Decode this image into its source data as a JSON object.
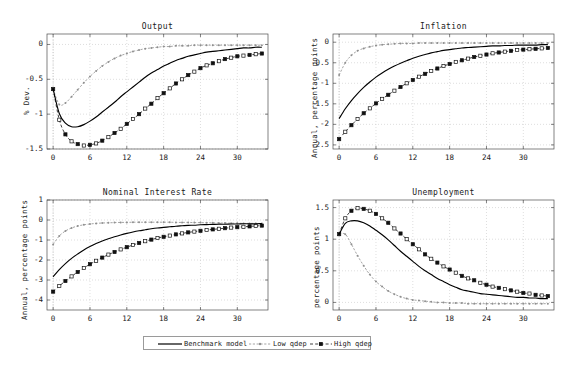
{
  "figure": {
    "width": 570,
    "height": 368,
    "background": "#ffffff",
    "foreground": "#1a1a1a"
  },
  "legend": {
    "entries": [
      {
        "label": "Benchmark model",
        "style": "solid-line",
        "color": "#000000"
      },
      {
        "label": "Low qdep",
        "style": "dotted-line-dot-marker",
        "color": "#8c8c8c"
      },
      {
        "label": "High qdep",
        "style": "dashed-line-square-marker",
        "color": "#000000"
      }
    ]
  },
  "chart_data": [
    {
      "type": "line",
      "title": "Output",
      "xlabel": "",
      "ylabel": "% Dev.",
      "xlim": [
        -1,
        35
      ],
      "ylim": [
        -1.5,
        0.15
      ],
      "xticks": [
        0,
        6,
        12,
        18,
        24,
        30
      ],
      "yticks": [
        0,
        -0.5,
        -1,
        -1.5
      ],
      "ytick_labels": [
        "0",
        "-0.5",
        "-1",
        "-1.5"
      ],
      "grid": true,
      "legend_position": "below-figure",
      "x": [
        0,
        1,
        2,
        3,
        4,
        5,
        6,
        7,
        8,
        9,
        10,
        11,
        12,
        13,
        14,
        15,
        16,
        17,
        18,
        19,
        20,
        21,
        22,
        23,
        24,
        25,
        26,
        27,
        28,
        29,
        30,
        31,
        32,
        33,
        34
      ],
      "series": [
        {
          "name": "Benchmark model",
          "values": [
            -0.64,
            -0.99,
            -1.13,
            -1.18,
            -1.18,
            -1.15,
            -1.1,
            -1.04,
            -0.97,
            -0.9,
            -0.83,
            -0.75,
            -0.68,
            -0.61,
            -0.54,
            -0.47,
            -0.41,
            -0.36,
            -0.31,
            -0.27,
            -0.23,
            -0.2,
            -0.17,
            -0.15,
            -0.13,
            -0.11,
            -0.1,
            -0.09,
            -0.08,
            -0.07,
            -0.06,
            -0.05,
            -0.05,
            -0.04,
            -0.04
          ]
        },
        {
          "name": "Low qdep",
          "values": [
            -0.64,
            -0.86,
            -0.84,
            -0.75,
            -0.65,
            -0.55,
            -0.46,
            -0.38,
            -0.31,
            -0.25,
            -0.2,
            -0.16,
            -0.13,
            -0.1,
            -0.08,
            -0.06,
            -0.05,
            -0.04,
            -0.03,
            -0.03,
            -0.02,
            -0.02,
            -0.02,
            -0.01,
            -0.01,
            -0.01,
            -0.01,
            -0.01,
            -0.01,
            -0.01,
            -0.01,
            -0.01,
            -0.01,
            -0.01,
            -0.01
          ]
        },
        {
          "name": "High qdep",
          "values": [
            -0.64,
            -1.08,
            -1.29,
            -1.39,
            -1.43,
            -1.45,
            -1.44,
            -1.42,
            -1.38,
            -1.33,
            -1.27,
            -1.21,
            -1.14,
            -1.07,
            -1.0,
            -0.92,
            -0.85,
            -0.77,
            -0.7,
            -0.63,
            -0.56,
            -0.5,
            -0.44,
            -0.39,
            -0.34,
            -0.3,
            -0.27,
            -0.24,
            -0.21,
            -0.19,
            -0.17,
            -0.16,
            -0.15,
            -0.14,
            -0.13
          ]
        }
      ]
    },
    {
      "type": "line",
      "title": "Inflation",
      "xlabel": "",
      "ylabel": "Annual, percentage points",
      "xlim": [
        -1,
        35
      ],
      "ylim": [
        -2.6,
        0.2
      ],
      "xticks": [
        0,
        6,
        12,
        18,
        24,
        30
      ],
      "yticks": [
        0,
        -0.5,
        -1,
        -1.5,
        -2,
        -2.5
      ],
      "ytick_labels": [
        "0",
        "-0.5",
        "-1",
        "-1.5",
        "-2",
        "-2.5"
      ],
      "grid": true,
      "legend_position": "below-figure",
      "x": [
        0,
        1,
        2,
        3,
        4,
        5,
        6,
        7,
        8,
        9,
        10,
        11,
        12,
        13,
        14,
        15,
        16,
        17,
        18,
        19,
        20,
        21,
        22,
        23,
        24,
        25,
        26,
        27,
        28,
        29,
        30,
        31,
        32,
        33,
        34
      ],
      "series": [
        {
          "name": "Benchmark model",
          "values": [
            -1.86,
            -1.62,
            -1.42,
            -1.25,
            -1.1,
            -0.97,
            -0.85,
            -0.75,
            -0.66,
            -0.58,
            -0.51,
            -0.45,
            -0.39,
            -0.34,
            -0.3,
            -0.26,
            -0.23,
            -0.2,
            -0.18,
            -0.16,
            -0.14,
            -0.13,
            -0.12,
            -0.11,
            -0.1,
            -0.09,
            -0.09,
            -0.08,
            -0.08,
            -0.07,
            -0.07,
            -0.07,
            -0.07,
            -0.06,
            -0.06
          ]
        },
        {
          "name": "Low qdep",
          "values": [
            -0.8,
            -0.5,
            -0.32,
            -0.21,
            -0.15,
            -0.11,
            -0.08,
            -0.06,
            -0.05,
            -0.04,
            -0.03,
            -0.03,
            -0.03,
            -0.02,
            -0.02,
            -0.02,
            -0.02,
            -0.02,
            -0.02,
            -0.02,
            -0.02,
            -0.02,
            -0.02,
            -0.02,
            -0.02,
            -0.02,
            -0.02,
            -0.02,
            -0.02,
            -0.02,
            -0.02,
            -0.02,
            -0.02,
            -0.02,
            -0.02
          ]
        },
        {
          "name": "High qdep",
          "values": [
            -2.36,
            -2.18,
            -2.02,
            -1.87,
            -1.73,
            -1.61,
            -1.49,
            -1.38,
            -1.28,
            -1.18,
            -1.09,
            -1.0,
            -0.92,
            -0.84,
            -0.77,
            -0.7,
            -0.64,
            -0.58,
            -0.53,
            -0.48,
            -0.44,
            -0.4,
            -0.36,
            -0.33,
            -0.3,
            -0.27,
            -0.25,
            -0.23,
            -0.21,
            -0.19,
            -0.18,
            -0.17,
            -0.16,
            -0.15,
            -0.14
          ]
        }
      ]
    },
    {
      "type": "line",
      "title": "Nominal Interest Rate",
      "xlabel": "",
      "ylabel": "Annual, percentage points",
      "xlim": [
        -1,
        35
      ],
      "ylim": [
        -4.5,
        1.0
      ],
      "xticks": [
        0,
        6,
        12,
        18,
        24,
        30
      ],
      "yticks": [
        1,
        0,
        -1,
        -2,
        -3,
        -4
      ],
      "ytick_labels": [
        "1",
        "0",
        "-1",
        "-2",
        "-3",
        "-4"
      ],
      "grid": true,
      "legend_position": "below-figure",
      "x": [
        0,
        1,
        2,
        3,
        4,
        5,
        6,
        7,
        8,
        9,
        10,
        11,
        12,
        13,
        14,
        15,
        16,
        17,
        18,
        19,
        20,
        21,
        22,
        23,
        24,
        25,
        26,
        27,
        28,
        29,
        30,
        31,
        32,
        33,
        34
      ],
      "series": [
        {
          "name": "Benchmark model",
          "values": [
            -2.84,
            -2.48,
            -2.18,
            -1.92,
            -1.7,
            -1.5,
            -1.33,
            -1.18,
            -1.05,
            -0.94,
            -0.84,
            -0.75,
            -0.67,
            -0.6,
            -0.54,
            -0.49,
            -0.44,
            -0.4,
            -0.37,
            -0.34,
            -0.31,
            -0.29,
            -0.27,
            -0.26,
            -0.24,
            -0.23,
            -0.22,
            -0.21,
            -0.21,
            -0.2,
            -0.2,
            -0.19,
            -0.19,
            -0.19,
            -0.18
          ]
        },
        {
          "name": "Low qdep",
          "values": [
            -1.22,
            -0.8,
            -0.55,
            -0.4,
            -0.3,
            -0.24,
            -0.2,
            -0.17,
            -0.15,
            -0.14,
            -0.13,
            -0.12,
            -0.12,
            -0.11,
            -0.11,
            -0.11,
            -0.11,
            -0.11,
            -0.11,
            -0.11,
            -0.12,
            -0.12,
            -0.12,
            -0.13,
            -0.13,
            -0.14,
            -0.14,
            -0.15,
            -0.15,
            -0.16,
            -0.16,
            -0.17,
            -0.17,
            -0.17,
            -0.18
          ]
        },
        {
          "name": "High qdep",
          "values": [
            -3.58,
            -3.3,
            -3.05,
            -2.82,
            -2.6,
            -2.4,
            -2.21,
            -2.04,
            -1.88,
            -1.73,
            -1.6,
            -1.47,
            -1.36,
            -1.25,
            -1.15,
            -1.06,
            -0.98,
            -0.9,
            -0.84,
            -0.78,
            -0.72,
            -0.67,
            -0.62,
            -0.58,
            -0.54,
            -0.5,
            -0.47,
            -0.44,
            -0.41,
            -0.38,
            -0.36,
            -0.34,
            -0.32,
            -0.3,
            -0.28
          ]
        }
      ]
    },
    {
      "type": "line",
      "title": "Unemployment",
      "xlabel": "",
      "ylabel": "percentage points",
      "xlim": [
        -1,
        35
      ],
      "ylim": [
        -0.12,
        1.62
      ],
      "xticks": [
        0,
        6,
        12,
        18,
        24,
        30
      ],
      "yticks": [
        1.5,
        1,
        0.5,
        0
      ],
      "ytick_labels": [
        "1.5",
        "1",
        "0.5",
        "0"
      ],
      "grid": true,
      "legend_position": "below-figure",
      "x": [
        0,
        1,
        2,
        3,
        4,
        5,
        6,
        7,
        8,
        9,
        10,
        11,
        12,
        13,
        14,
        15,
        16,
        17,
        18,
        19,
        20,
        21,
        22,
        23,
        24,
        25,
        26,
        27,
        28,
        29,
        30,
        31,
        32,
        33,
        34
      ],
      "series": [
        {
          "name": "Benchmark model",
          "values": [
            1.08,
            1.25,
            1.29,
            1.29,
            1.26,
            1.21,
            1.14,
            1.07,
            0.99,
            0.9,
            0.81,
            0.73,
            0.65,
            0.57,
            0.5,
            0.44,
            0.38,
            0.33,
            0.28,
            0.24,
            0.2,
            0.18,
            0.16,
            0.14,
            0.13,
            0.12,
            0.11,
            0.1,
            0.09,
            0.08,
            0.08,
            0.07,
            0.07,
            0.06,
            0.06
          ]
        },
        {
          "name": "Low qdep",
          "values": [
            1.08,
            1.08,
            0.92,
            0.74,
            0.58,
            0.44,
            0.33,
            0.25,
            0.18,
            0.13,
            0.09,
            0.06,
            0.04,
            0.03,
            0.02,
            0.01,
            0.0,
            0.0,
            -0.01,
            -0.01,
            -0.01,
            -0.02,
            -0.02,
            -0.02,
            -0.02,
            -0.02,
            -0.02,
            -0.02,
            -0.02,
            -0.02,
            -0.02,
            -0.02,
            -0.02,
            -0.02,
            -0.02
          ]
        },
        {
          "name": "High qdep",
          "values": [
            1.08,
            1.33,
            1.45,
            1.49,
            1.48,
            1.45,
            1.4,
            1.33,
            1.26,
            1.17,
            1.09,
            1.0,
            0.92,
            0.84,
            0.76,
            0.69,
            0.63,
            0.57,
            0.52,
            0.47,
            0.42,
            0.38,
            0.35,
            0.31,
            0.28,
            0.25,
            0.23,
            0.21,
            0.19,
            0.17,
            0.15,
            0.14,
            0.12,
            0.11,
            0.1
          ]
        }
      ]
    }
  ]
}
